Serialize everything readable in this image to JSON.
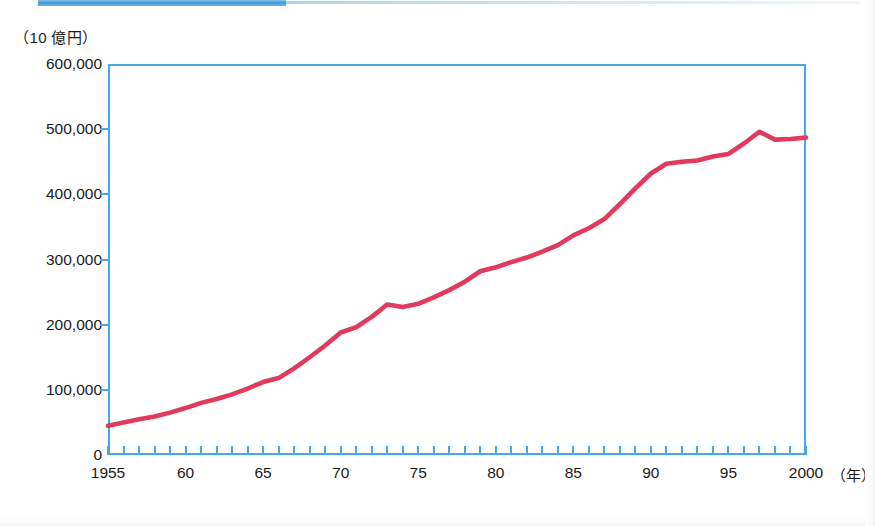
{
  "header": {
    "band_color": "#3d9bd8"
  },
  "axis": {
    "y_unit_label": "（10 億円）",
    "x_unit_label": "（年）"
  },
  "colors": {
    "line": "#e03a5c",
    "frame": "#4aa8e0",
    "band": "#3d9bd8",
    "text": "#1a1a1a"
  },
  "chart_data": {
    "type": "line",
    "title": "",
    "subtitle": "",
    "xlabel": "（年）",
    "ylabel": "（10 億円）",
    "xlim": [
      1955,
      2000
    ],
    "ylim": [
      0,
      600000
    ],
    "grid": false,
    "legend": "none",
    "y_ticks": [
      0,
      100000,
      200000,
      300000,
      400000,
      500000,
      600000
    ],
    "y_tick_labels": [
      "0",
      "100,000",
      "200,000",
      "300,000",
      "400,000",
      "500,000",
      "600,000"
    ],
    "x_ticks": [
      1955,
      1960,
      1965,
      1970,
      1975,
      1980,
      1985,
      1990,
      1995,
      2000
    ],
    "x_tick_labels": [
      "1955",
      "60",
      "65",
      "70",
      "75",
      "80",
      "85",
      "90",
      "95",
      "2000"
    ],
    "x_minor_tick_step": 1,
    "series": [
      {
        "name": "実質国内総生産",
        "color": "#e03a5c",
        "x": [
          1955,
          1956,
          1957,
          1958,
          1959,
          1960,
          1961,
          1962,
          1963,
          1964,
          1965,
          1966,
          1967,
          1968,
          1969,
          1970,
          1971,
          1972,
          1973,
          1974,
          1975,
          1976,
          1977,
          1978,
          1979,
          1980,
          1981,
          1982,
          1983,
          1984,
          1985,
          1986,
          1987,
          1988,
          1989,
          1990,
          1991,
          1992,
          1993,
          1994,
          1995,
          1996,
          1997,
          1998,
          1999,
          2000
        ],
        "values": [
          45000,
          50000,
          55000,
          59000,
          65000,
          72000,
          80000,
          86000,
          93000,
          102000,
          112000,
          118000,
          133000,
          150000,
          168000,
          188000,
          196000,
          212000,
          231000,
          227000,
          232000,
          242000,
          253000,
          266000,
          282000,
          288000,
          296000,
          303000,
          312000,
          322000,
          337000,
          348000,
          362000,
          385000,
          409000,
          432000,
          447000,
          450000,
          452000,
          458000,
          462000,
          478000,
          496000,
          484000,
          485000,
          487000
        ]
      }
    ],
    "annotations": []
  }
}
